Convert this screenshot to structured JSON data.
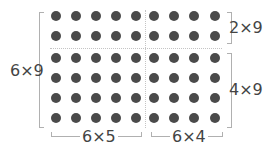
{
  "diagram": {
    "rows": 6,
    "cols": 9,
    "dot_color": "#4a4a4a",
    "split_col_after": 5,
    "split_row_after": 2,
    "labels": {
      "left": "6×9",
      "top_right": "2×9",
      "bottom_right": "4×9",
      "bottom_left": "6×5",
      "bottom_right_cols": "6×4"
    }
  }
}
